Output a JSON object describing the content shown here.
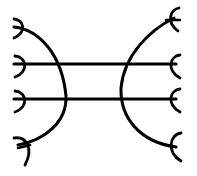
{
  "diagram": {
    "stroke_color": "#000000",
    "background_color": "#ffffff",
    "horizontal_bars": [
      {
        "y": 64,
        "x1": 14,
        "x2": 176
      },
      {
        "y": 99,
        "x1": 14,
        "x2": 176
      }
    ],
    "left_hooks_y": [
      27,
      64,
      99,
      143
    ],
    "right_forks_y": [
      18,
      64,
      99,
      147
    ]
  }
}
